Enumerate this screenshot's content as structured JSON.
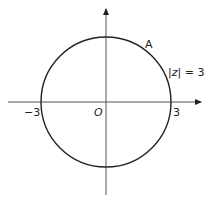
{
  "diagram": {
    "type": "argand-diagram-circle",
    "center": {
      "x": 0,
      "y": 0
    },
    "radius": 3,
    "labels": {
      "origin": "O",
      "neg_x_intercept": "−3",
      "pos_x_intercept": "3",
      "point": "A",
      "equation_prefix": "|",
      "equation_var": "z",
      "equation_suffix": "| = 3"
    },
    "colors": {
      "stroke": "#222222",
      "axis": "#555555",
      "background": "#ffffff"
    }
  }
}
